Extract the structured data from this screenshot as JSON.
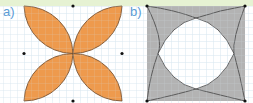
{
  "panels": [
    {
      "label": "a)",
      "shape": "four-petal flower formed by quarter-circle arcs",
      "fill": "#ee9a4d"
    },
    {
      "label": "b)",
      "shape": "square minus four-arc curved region (shaded corners)",
      "fill": "#b3b3b3"
    }
  ],
  "colors": {
    "grid": "#d6e4ef",
    "band": "#e6f2d3",
    "label": "#5b9bd5",
    "stroke": "#5a4030",
    "dot": "#111111"
  }
}
